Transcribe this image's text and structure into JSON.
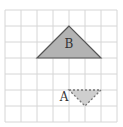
{
  "grid": {
    "x0": 5,
    "y0": 10,
    "cell": 16,
    "cols": 7,
    "rows": 7,
    "line_color": "#d6d6d6"
  },
  "triangles": [
    {
      "label": "B",
      "points": "69,26 37,58 101,58",
      "fill": "#b3b3b3",
      "stroke": "#555555",
      "style": "solid",
      "label_pos": [
        69,
        48
      ]
    },
    {
      "label": "A",
      "points": "69,90 101,90 85,106",
      "fill": "#cfcfcf",
      "stroke": "#777777",
      "style": "dashed",
      "label_pos": [
        64,
        101
      ]
    }
  ]
}
